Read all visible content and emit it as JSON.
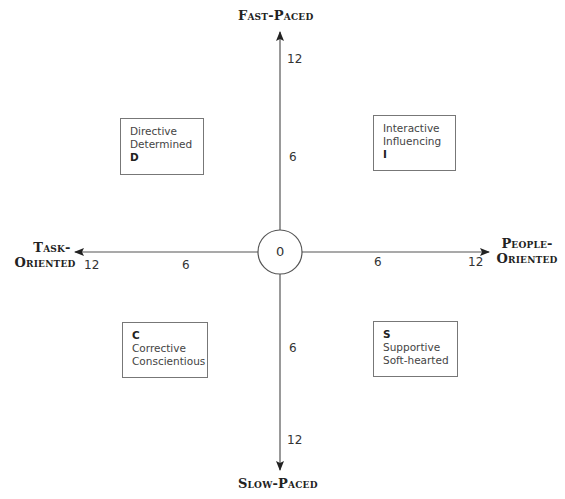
{
  "axes": {
    "top": "Fast-Paced",
    "bottom": "Slow-Paced",
    "left_line1": "Task-",
    "left_line2": "Oriented",
    "right_line1": "People-",
    "right_line2": "Oriented"
  },
  "origin": "0",
  "ticks": {
    "up_12": "12",
    "up_6": "6",
    "down_6": "6",
    "down_12": "12",
    "left_12": "12",
    "left_6": "6",
    "right_6": "6",
    "right_12": "12"
  },
  "quadrants": {
    "d": {
      "line1": "Directive",
      "line2": "Determined",
      "letter": "D"
    },
    "i": {
      "line1": "Interactive",
      "line2": "Influencing",
      "letter": "I"
    },
    "c": {
      "letter": "C",
      "line1": "Corrective",
      "line2": "Conscientious"
    },
    "s": {
      "letter": "S",
      "line1": "Supportive",
      "line2": "Soft-hearted"
    }
  },
  "colors": {
    "axis_line": "#555555",
    "box_border": "#777777",
    "text": "#333333"
  }
}
